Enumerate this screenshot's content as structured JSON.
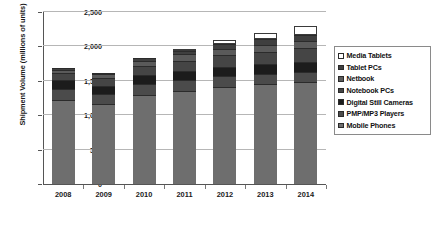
{
  "chart_data": {
    "type": "bar",
    "stacked": true,
    "title": "",
    "xlabel": "",
    "ylabel": "Shipment Volume (millions of units)",
    "categories": [
      "2008",
      "2009",
      "2010",
      "2011",
      "2012",
      "2013",
      "2014"
    ],
    "ylim": [
      0,
      2500
    ],
    "yticks": [
      0,
      500,
      1000,
      1500,
      2000,
      2500
    ],
    "ytick_labels": [
      "0",
      "500",
      "1,000",
      "1,500",
      "2,000",
      "2,500"
    ],
    "grid": true,
    "legend_position": "right",
    "series": [
      {
        "name": "Media Tablets",
        "color": "#ffffff",
        "values": [
          0,
          0,
          0,
          20,
          55,
          90,
          130
        ]
      },
      {
        "name": "Tablet PCs",
        "color": "#3f3f3f",
        "values": [
          30,
          25,
          35,
          55,
          70,
          85,
          95
        ]
      },
      {
        "name": "Netbook",
        "color": "#5a5a5a",
        "values": [
          40,
          55,
          75,
          90,
          95,
          100,
          100
        ]
      },
      {
        "name": "Notebook PCs",
        "color": "#454545",
        "values": [
          115,
          110,
          135,
          150,
          165,
          180,
          195
        ]
      },
      {
        "name": "Digital Still Cameras",
        "color": "#1c1c1c",
        "values": [
          120,
          125,
          130,
          135,
          140,
          145,
          150
        ]
      },
      {
        "name": "PMP/MP3 Players",
        "color": "#4b4b4b",
        "values": [
          165,
          145,
          155,
          160,
          155,
          150,
          145
        ]
      },
      {
        "name": "Mobile Phones",
        "color": "#6e6e6e",
        "values": [
          1220,
          1160,
          1300,
          1350,
          1410,
          1450,
          1485
        ]
      }
    ],
    "totals": [
      1690,
      1620,
      1830,
      1960,
      2090,
      2200,
      2300
    ]
  }
}
